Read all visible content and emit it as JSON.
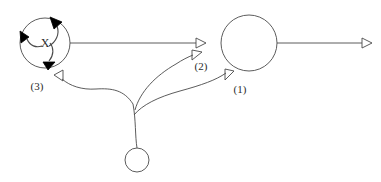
{
  "figure": {
    "type": "node-link-diagram",
    "background_color": "#ffffff",
    "stroke_color": "#4a4a4a",
    "fill_color": "#000000",
    "text_color": "#2b2b2b",
    "width": 381,
    "height": 182
  },
  "nodes": [
    {
      "id": "node-x",
      "label": "X",
      "shape": "circle",
      "cx": 45,
      "cy": 43,
      "r": 25,
      "filled": false,
      "label_cx": 45,
      "label_cy": 47
    },
    {
      "id": "node-large",
      "label": "",
      "shape": "circle",
      "cx": 249,
      "cy": 43,
      "r": 28,
      "filled": false
    },
    {
      "id": "node-small",
      "label": "",
      "shape": "circle",
      "cx": 137,
      "cy": 160,
      "r": 12,
      "filled": false
    }
  ],
  "internal_arrows": {
    "description": "three filled arrowheads on node-x boundary with arcs toward center label",
    "arrowheads": [
      {
        "name": "arrowhead-top-right",
        "x": 55,
        "y": 22,
        "angle": 125
      },
      {
        "name": "arrowhead-left",
        "x": 24,
        "y": 37,
        "angle": 10
      },
      {
        "name": "arrowhead-bottom",
        "x": 49,
        "y": 64,
        "angle": 240
      }
    ]
  },
  "edges": [
    {
      "id": "edge-x-to-2",
      "label": "",
      "style": "straight",
      "from": "node-x",
      "to": "arrowhead-2-upper",
      "arrow": "hollow-left"
    },
    {
      "id": "edge-large-to-right",
      "label": "",
      "style": "straight",
      "from": "node-large",
      "to": "right-terminal",
      "arrow": "hollow-left"
    },
    {
      "id": "edge-3",
      "label": "(3)",
      "style": "curved",
      "from": "junction",
      "to": "node-x",
      "arrow": "hollow",
      "label_x": 37,
      "label_y": 90
    },
    {
      "id": "edge-2",
      "label": "(2)",
      "style": "curved",
      "from": "junction",
      "to": "arrowhead-2-lower",
      "arrow": "hollow",
      "label_x": 200,
      "label_y": 70
    },
    {
      "id": "edge-1",
      "label": "(1)",
      "style": "curved",
      "from": "junction",
      "to": "node-large",
      "arrow": "hollow",
      "label_x": 240,
      "label_y": 92
    }
  ],
  "labels": {
    "node_x": "X",
    "edge_one": "(1)",
    "edge_two": "(2)",
    "edge_three": "(3)"
  }
}
